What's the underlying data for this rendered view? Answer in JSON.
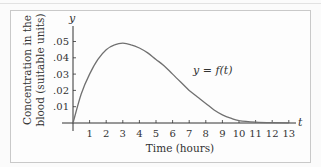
{
  "chart_data": {
    "type": "line",
    "title": "",
    "xlabel": "Time (hours)",
    "ylabel": "Concentration in the blood (suitable units)",
    "ylabel_lines": [
      "Concentration in the",
      "blood (suitable units)"
    ],
    "x_axis_symbol": "t",
    "y_axis_symbol": "y",
    "x_ticks": [
      "1",
      "2",
      "3",
      "4",
      "5",
      "6",
      "7",
      "8",
      "9",
      "10",
      "11",
      "12",
      "13"
    ],
    "y_ticks": [
      ".01",
      ".02",
      ".03",
      ".04",
      ".05"
    ],
    "xlim": [
      0,
      13.5
    ],
    "ylim": [
      0,
      0.055
    ],
    "grid": false,
    "annotation": "y = f(t)",
    "series": [
      {
        "name": "y = f(t)",
        "x": [
          0,
          0.5,
          1,
          1.5,
          2,
          2.5,
          3,
          3.5,
          4,
          4.5,
          5,
          5.5,
          6,
          6.5,
          7,
          7.5,
          8,
          8.5,
          9,
          9.5,
          10,
          11,
          12,
          13
        ],
        "y": [
          0,
          0.018,
          0.03,
          0.039,
          0.045,
          0.048,
          0.049,
          0.048,
          0.046,
          0.043,
          0.039,
          0.035,
          0.03,
          0.025,
          0.02,
          0.016,
          0.012,
          0.008,
          0.005,
          0.003,
          0.0015,
          0.0005,
          0.0002,
          0.0001
        ]
      }
    ]
  },
  "colors": {
    "curve": "#707070",
    "axis": "#333333",
    "text": "#333333",
    "frame": "#c9c9c9"
  }
}
